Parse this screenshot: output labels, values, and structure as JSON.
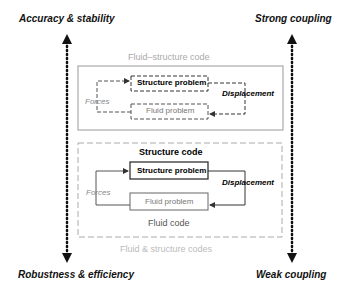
{
  "axes": {
    "top_left": "Accuracy & stability",
    "bottom_left": "Robustness & efficiency",
    "top_right": "Strong coupling",
    "bottom_right": "Weak coupling"
  },
  "monolithic": {
    "title": "Fluid–structure code",
    "structure": "Structure problem",
    "fluid": "Fluid problem",
    "forces": "Forces",
    "displacement": "Displacement"
  },
  "partitioned": {
    "structure_code": "Structure code",
    "fluid_code": "Fluid code",
    "structure": "Structure problem",
    "fluid": "Fluid problem",
    "forces": "Forces",
    "displacement": "Displacement",
    "caption": "Fluid & structure codes"
  }
}
